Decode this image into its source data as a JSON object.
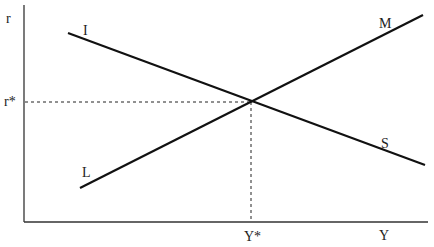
{
  "diagram": {
    "type": "IS-LM",
    "axes": {
      "y_label": "r",
      "x_label": "Y",
      "origin": [
        24,
        222
      ],
      "y_top": 5,
      "x_right": 428
    },
    "curves": [
      {
        "id": "IS",
        "start_label": "I",
        "end_label": "S",
        "from": [
          68,
          33
        ],
        "to": [
          425,
          165
        ],
        "start_label_pos": [
          70,
          35
        ],
        "end_label_pos": [
          380,
          150
        ]
      },
      {
        "id": "LM",
        "start_label": "L",
        "end_label": "M",
        "from": [
          80,
          188
        ],
        "to": [
          423,
          15
        ],
        "start_label_pos": [
          83,
          177
        ],
        "end_label_pos": [
          372,
          27
        ]
      }
    ],
    "equilibrium": {
      "point": [
        251,
        102
      ],
      "r_label": "r*",
      "y_label": "Y*"
    },
    "colors": {
      "line": "#111111",
      "axis": "#333333",
      "text": "#222222"
    }
  }
}
